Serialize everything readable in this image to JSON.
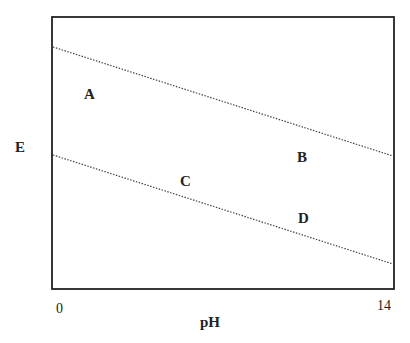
{
  "diagram": {
    "title": "",
    "axis": {
      "xlabel": "pH",
      "ylabel": "E",
      "xmin_label": "0",
      "xmax_label": "14"
    },
    "regions": [
      {
        "label": "A"
      },
      {
        "label": "B"
      },
      {
        "label": "C"
      },
      {
        "label": "D"
      }
    ],
    "lines": [
      {
        "name": "upper-dotted-line",
        "style": "dotted"
      },
      {
        "name": "lower-dotted-line",
        "style": "dotted"
      }
    ]
  }
}
